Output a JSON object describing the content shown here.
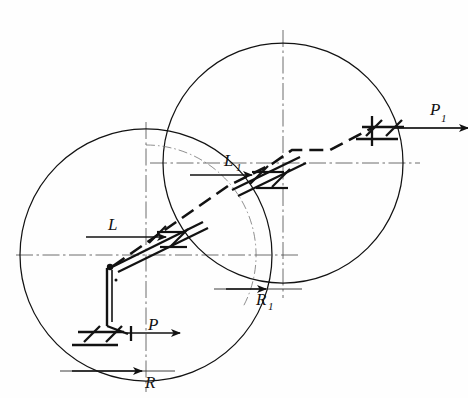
{
  "figure": {
    "background_color": "#fefefe",
    "line_color": "#121212",
    "centerline_color": "#3a3a3a",
    "width": 468,
    "height": 398
  },
  "circles": [
    {
      "name": "left-circle",
      "cx": 146,
      "cy": 255,
      "r": 126,
      "style": "solid"
    },
    {
      "name": "right-circle",
      "cx": 283,
      "cy": 163,
      "r": 120,
      "style": "solid"
    },
    {
      "name": "left-circle-inner-arc",
      "cx": 146,
      "cy": 255,
      "r": 110,
      "style": "dash-dot"
    }
  ],
  "centerlines": [
    {
      "name": "left-horizontal-centerline",
      "x1": 16,
      "y1": 255,
      "x2": 300,
      "y2": 255
    },
    {
      "name": "left-vertical-centerline",
      "x1": 146,
      "y1": 122,
      "x2": 146,
      "y2": 390
    },
    {
      "name": "right-horizontal-centerline",
      "x1": 150,
      "y1": 163,
      "x2": 420,
      "y2": 163
    },
    {
      "name": "right-vertical-centerline",
      "x1": 283,
      "y1": 30,
      "x2": 283,
      "y2": 296
    }
  ],
  "labels": [
    {
      "name": "label-L",
      "base": "L",
      "sub": "",
      "x": 111,
      "y": 232
    },
    {
      "name": "label-L1",
      "base": "L",
      "sub": "1",
      "x": 225,
      "y": 163
    },
    {
      "name": "label-P",
      "base": "P",
      "sub": "",
      "x": 150,
      "y": 328
    },
    {
      "name": "label-P1",
      "base": "P",
      "sub": "1",
      "x": 434,
      "y": 115
    },
    {
      "name": "label-R",
      "base": "R",
      "sub": "",
      "x": 147,
      "y": 384
    },
    {
      "name": "label-R1",
      "base": "R",
      "sub": "1",
      "x": 259,
      "y": 301
    }
  ],
  "force_arrows": [
    {
      "name": "arrow-L",
      "label": "L",
      "direction": "right",
      "x1": 102,
      "y1": 237,
      "x2": 160,
      "y2": 237
    },
    {
      "name": "arrow-L1",
      "label": "L1",
      "direction": "right",
      "x1": 196,
      "y1": 175,
      "x2": 246,
      "y2": 175
    },
    {
      "name": "arrow-P",
      "label": "P",
      "direction": "left",
      "x1": 176,
      "y1": 333,
      "x2": 128,
      "y2": 333
    },
    {
      "name": "arrow-P1",
      "label": "P1",
      "direction": "left",
      "x1": 462,
      "y1": 128,
      "x2": 392,
      "y2": 128
    },
    {
      "name": "arrow-R",
      "label": "R",
      "direction": "right",
      "x1": 76,
      "y1": 372,
      "x2": 140,
      "y2": 372
    },
    {
      "name": "arrow-R1",
      "label": "R1",
      "direction": "right",
      "x1": 228,
      "y1": 290,
      "x2": 262,
      "y2": 290
    }
  ],
  "dimension_lines": [
    {
      "name": "dim-line-R",
      "x1": 62,
      "y1": 372,
      "x2": 168,
      "y2": 372
    },
    {
      "name": "dim-line-R1",
      "x1": 216,
      "y1": 290,
      "x2": 300,
      "y2": 290
    }
  ],
  "links": [
    {
      "name": "main-diagonal-link",
      "description": "hatched bar running lower-left to upper-right through both circle centres",
      "from": [
        112,
        266
      ],
      "to": [
        383,
        128
      ]
    },
    {
      "name": "dashed-linkage-path",
      "description": "dash segments from lower-left pivot up to upper-right support",
      "points": [
        [
          112,
          266
        ],
        [
          228,
          186
        ],
        [
          283,
          163
        ],
        [
          292,
          150
        ],
        [
          330,
          150
        ],
        [
          372,
          128
        ]
      ]
    },
    {
      "name": "vertical-drop-link",
      "description": "vertical member from pivot down to lower hatched support",
      "from": [
        108,
        268
      ],
      "to": [
        134,
        333
      ]
    }
  ],
  "supports": [
    {
      "name": "support-hatched-lower-left",
      "x": 110,
      "y": 333,
      "angle": 0
    },
    {
      "name": "support-hatched-upper-right",
      "x": 383,
      "y": 128,
      "angle": 0
    },
    {
      "name": "support-hatched-mid-left",
      "x": 170,
      "y": 238,
      "angle": -28
    },
    {
      "name": "support-hatched-mid-right",
      "x": 262,
      "y": 174,
      "angle": -28
    }
  ],
  "pivot": {
    "name": "pivot-point",
    "x": 110,
    "y": 267
  }
}
